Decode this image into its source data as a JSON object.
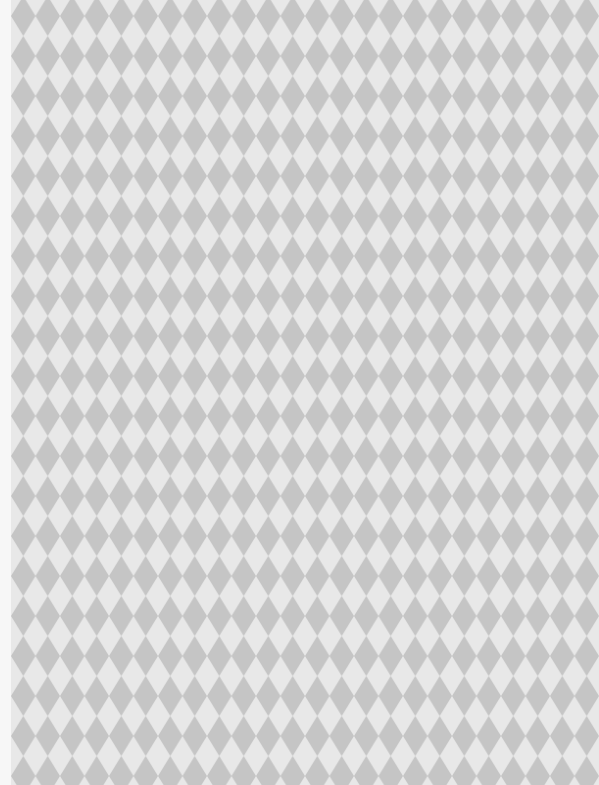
{
  "pattern": {
    "name": "harlequin-diamond-pattern",
    "colors": {
      "dark_diamond": "#c4c4c4",
      "light_diamond": "#e8e8e8",
      "edge_strip": "#f6f6f6"
    },
    "tile_width": 24.5,
    "tile_height": 40
  }
}
